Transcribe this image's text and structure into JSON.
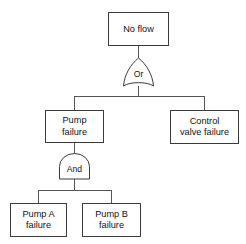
{
  "diagram": {
    "type": "fault-tree",
    "title": "",
    "background_color": "#ffffff",
    "line_color": "#3a3a3a",
    "connector_color": "#555555",
    "text_color": "#111111",
    "nodes": [
      {
        "id": "top-event",
        "kind": "event-box",
        "label_line1": "No flow",
        "label_line2": "",
        "x": 108,
        "y": 12,
        "w": 60,
        "h": 33
      },
      {
        "id": "pump-failure",
        "kind": "event-box",
        "label_line1": "Pump",
        "label_line2": "failure",
        "x": 45,
        "y": 110,
        "w": 58,
        "h": 32
      },
      {
        "id": "control-valve-failure",
        "kind": "event-box",
        "label_line1": "Control",
        "label_line2": "valve failure",
        "x": 170,
        "y": 110,
        "w": 68,
        "h": 33
      },
      {
        "id": "pump-a-failure",
        "kind": "event-box",
        "label_line1": "Pump A",
        "label_line2": "failure",
        "x": 10,
        "y": 203,
        "w": 56,
        "h": 33
      },
      {
        "id": "pump-b-failure",
        "kind": "event-box",
        "label_line1": "Pump B",
        "label_line2": "failure",
        "x": 82,
        "y": 203,
        "w": 58,
        "h": 33
      }
    ],
    "gates": [
      {
        "id": "or-gate",
        "kind": "or-gate",
        "label": "Or",
        "cx": 138,
        "top": 58,
        "bottom": 86,
        "half_width": 15
      },
      {
        "id": "and-gate",
        "kind": "and-gate",
        "label": "And",
        "cx": 74,
        "top": 154,
        "bottom": 179,
        "half_width": 15
      }
    ],
    "connectors": [
      {
        "id": "top-to-or",
        "from": "top-event",
        "to": "or-gate"
      },
      {
        "id": "or-to-pump-failure",
        "from": "or-gate",
        "to": "pump-failure"
      },
      {
        "id": "or-to-control-valve",
        "from": "or-gate",
        "to": "control-valve-failure"
      },
      {
        "id": "pump-failure-to-and",
        "from": "pump-failure",
        "to": "and-gate"
      },
      {
        "id": "and-to-pump-a",
        "from": "and-gate",
        "to": "pump-a-failure"
      },
      {
        "id": "and-to-pump-b",
        "from": "and-gate",
        "to": "pump-b-failure"
      }
    ]
  }
}
